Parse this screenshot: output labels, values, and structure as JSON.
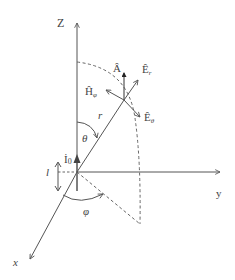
{
  "diagram": {
    "axes": {
      "z_label": "Z",
      "y_label": "y",
      "x_label": "x"
    },
    "labels": {
      "A_hat": "Â",
      "E_r": "Ê",
      "E_r_sub": "r",
      "H_phi": "Ĥ",
      "H_phi_sub": "φ",
      "E_theta": "Ê",
      "E_theta_sub": "θ",
      "r": "r",
      "theta": "θ",
      "phi": "φ",
      "I0": "İ",
      "I0_sub": "0",
      "l": "l"
    },
    "colors": {
      "line": "#555555",
      "dashed": "#666666",
      "text": "#444444",
      "background": "#ffffff"
    }
  }
}
